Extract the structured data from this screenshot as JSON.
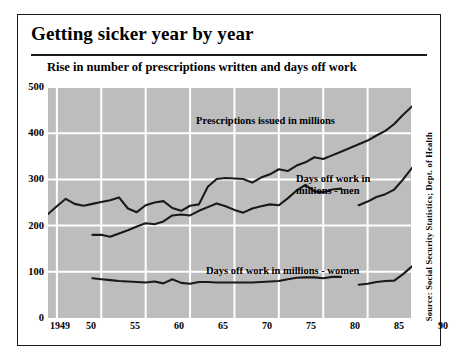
{
  "figure": {
    "title": "Getting sicker year by year",
    "subtitle": "Rise in number of prescriptions written and days off work",
    "source": "Source: Social Security Statistics; Dept. of Health",
    "colors": {
      "plot_background": "#bdbdbd",
      "gridline": "#ffffff",
      "line": "#1a1a1a",
      "frame": "#1a1a1a",
      "page_background": "#ffffff"
    }
  },
  "chart_data": {
    "type": "line",
    "title": "Getting sicker year by year",
    "subtitle": "Rise in number of prescriptions written and days off work",
    "xlabel": "",
    "ylabel": "",
    "xlim": [
      1949,
      1990
    ],
    "ylim": [
      0,
      500
    ],
    "grid": true,
    "legend_position": "inline-annotations",
    "yticks": [
      0,
      100,
      200,
      300,
      400,
      500
    ],
    "xticks": [
      1949,
      1950,
      1955,
      1960,
      1965,
      1970,
      1975,
      1980,
      1985,
      1990
    ],
    "xticklabels": [
      "1949",
      "50",
      "55",
      "60",
      "65",
      "70",
      "75",
      "80",
      "85",
      "90"
    ],
    "series": [
      {
        "name": "Prescriptions issued in millions",
        "label": "Prescriptions issued in millions",
        "x": [
          1949,
          1950,
          1951,
          1952,
          1953,
          1954,
          1955,
          1956,
          1957,
          1958,
          1959,
          1960,
          1961,
          1962,
          1963,
          1964,
          1965,
          1966,
          1967,
          1968,
          1969,
          1970,
          1971,
          1972,
          1973,
          1974,
          1975,
          1976,
          1977,
          1978,
          1979,
          1980,
          1981,
          1982,
          1983,
          1984,
          1985,
          1986,
          1987,
          1988,
          1989,
          1990
        ],
        "values": [
          225,
          242,
          258,
          247,
          243,
          247,
          251,
          255,
          261,
          237,
          229,
          244,
          250,
          253,
          238,
          232,
          243,
          246,
          284,
          301,
          303,
          302,
          301,
          293,
          304,
          311,
          322,
          318,
          330,
          337,
          348,
          344,
          352,
          360,
          368,
          376,
          384,
          395,
          405,
          420,
          440,
          458
        ]
      },
      {
        "name": "Days off work in millions - men",
        "label": "Days off work in millions - men",
        "x": [
          1954,
          1955,
          1956,
          1957,
          1958,
          1959,
          1960,
          1961,
          1962,
          1963,
          1964,
          1965,
          1966,
          1967,
          1968,
          1969,
          1970,
          1971,
          1972,
          1973,
          1974,
          1975,
          1976,
          1977,
          1978,
          1979,
          1980,
          1981,
          1982,
          1984,
          1985,
          1986,
          1987,
          1988,
          1989,
          1990
        ],
        "values": [
          180,
          180,
          176,
          183,
          190,
          198,
          205,
          203,
          209,
          222,
          224,
          222,
          232,
          240,
          248,
          242,
          234,
          228,
          237,
          242,
          246,
          244,
          259,
          276,
          288,
          274,
          272,
          278,
          280,
          244,
          252,
          262,
          268,
          278,
          300,
          325
        ],
        "gap_after_year": 1982
      },
      {
        "name": "Days off work in millions - women",
        "label": "Days off work in millions - women",
        "x": [
          1954,
          1955,
          1956,
          1957,
          1958,
          1959,
          1960,
          1961,
          1962,
          1963,
          1964,
          1965,
          1966,
          1967,
          1968,
          1969,
          1970,
          1971,
          1972,
          1973,
          1974,
          1975,
          1976,
          1977,
          1978,
          1979,
          1980,
          1981,
          1982,
          1984,
          1985,
          1986,
          1987,
          1988,
          1989,
          1990
        ],
        "values": [
          86,
          84,
          82,
          80,
          79,
          78,
          77,
          79,
          75,
          84,
          76,
          74,
          78,
          78,
          77,
          77,
          77,
          77,
          77,
          78,
          79,
          80,
          84,
          87,
          88,
          88,
          86,
          89,
          89,
          72,
          74,
          78,
          80,
          81,
          95,
          112
        ],
        "gap_after_year": 1982
      }
    ],
    "annotations": [
      {
        "text": "Prescriptions issued in millions",
        "x": 1969,
        "y": 420
      },
      {
        "text": "Days off work in millions - men",
        "x": 1978,
        "y": 330
      },
      {
        "text": "Days off work in millions - women",
        "x": 1970,
        "y": 125
      }
    ]
  },
  "axis": {
    "y_ticks": [
      "500",
      "400",
      "300",
      "200",
      "100",
      "0"
    ],
    "x_ticks": [
      "1949",
      "50",
      "55",
      "60",
      "65",
      "70",
      "75",
      "80",
      "85",
      "90"
    ]
  },
  "labels": {
    "prescriptions": "Prescriptions issued in millions",
    "men_line1": "Days off work in",
    "men_line2": "millions - men",
    "women": "Days off work in millions - women"
  }
}
